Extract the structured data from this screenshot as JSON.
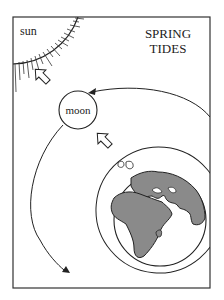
{
  "title": {
    "line1": "SPRING",
    "line2": "TIDES"
  },
  "labels": {
    "sun": "sun",
    "moon": "moon"
  },
  "colors": {
    "ink": "#222222",
    "land": "#8a8a8a",
    "background": "#ffffff"
  },
  "elements": [
    {
      "name": "sun",
      "type": "quarter-circle with rays",
      "position": "top-left corner"
    },
    {
      "name": "moon",
      "type": "circle"
    },
    {
      "name": "earth",
      "type": "globe showing Europe and Africa"
    },
    {
      "name": "tidal-bulge",
      "type": "ellipse around earth"
    },
    {
      "name": "gravity-arrow-moon-to-sun",
      "type": "hollow arrow"
    },
    {
      "name": "gravity-arrow-earth-to-moon",
      "type": "hollow arrow"
    },
    {
      "name": "orbit-arrow-upper",
      "type": "curved arrow"
    },
    {
      "name": "orbit-arrow-lower",
      "type": "curved arrow"
    }
  ]
}
